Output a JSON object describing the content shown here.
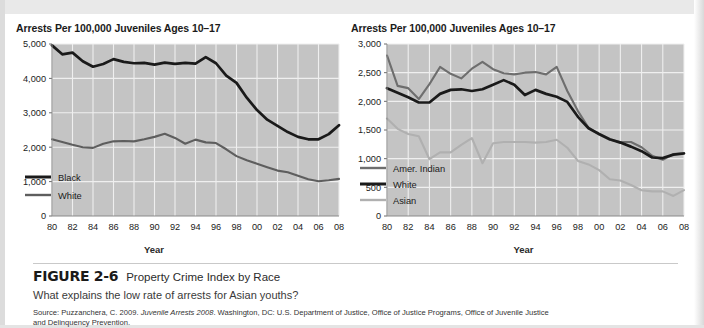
{
  "figure": {
    "number": "FIGURE 2-6",
    "title": "Property Crime Index by Race",
    "question": "What explains the low rate of arrests for Asian youths?",
    "source_prefix": "Source: Puzzanchera, C. 2009. ",
    "source_italic": "Juvenile Arrests 2008",
    "source_suffix": ". Washington, DC: U.S. Department of Justice, Office of Justice Programs, Office of Juvenile Justice",
    "source_line2": "and Delinquency Prevention."
  },
  "colors": {
    "plot_background": "#c4c4c4",
    "gridline": "#efefef",
    "black_series": "#1a1a1a",
    "white_series": "#5e5e5e",
    "amer_indian_series": "#6e6e6e",
    "asian_series": "#b0b0b0",
    "text": "#1b1b1b"
  },
  "chart_data": [
    {
      "id": "left",
      "type": "line",
      "title": "Arrests Per 100,000 Juveniles Ages 10–17",
      "xlabel": "Year",
      "ylabel": "",
      "ylim": [
        0,
        5000
      ],
      "yticks": [
        0,
        1000,
        2000,
        3000,
        4000,
        5000
      ],
      "ytick_labels": [
        "0",
        "1,000",
        "2,000",
        "3,000",
        "4,000",
        "5,000"
      ],
      "x": [
        1980,
        1981,
        1982,
        1983,
        1984,
        1985,
        1986,
        1987,
        1988,
        1989,
        1990,
        1991,
        1992,
        1993,
        1994,
        1995,
        1996,
        1997,
        1998,
        1999,
        2000,
        2001,
        2002,
        2003,
        2004,
        2005,
        2006,
        2007,
        2008
      ],
      "xtick_labels": [
        "80",
        "82",
        "84",
        "86",
        "88",
        "90",
        "92",
        "94",
        "96",
        "98",
        "00",
        "02",
        "04",
        "06",
        "08"
      ],
      "grid": true,
      "legend_position": "inside-lower-left",
      "series": [
        {
          "name": "Black",
          "color": "#1a1a1a",
          "values": [
            4960,
            4700,
            4750,
            4500,
            4340,
            4420,
            4560,
            4480,
            4440,
            4450,
            4400,
            4460,
            4420,
            4450,
            4430,
            4620,
            4440,
            4080,
            3870,
            3440,
            3080,
            2800,
            2620,
            2440,
            2300,
            2230,
            2230,
            2380,
            2640
          ]
        },
        {
          "name": "White",
          "color": "#5e5e5e",
          "values": [
            2230,
            2150,
            2070,
            2000,
            1980,
            2100,
            2170,
            2180,
            2170,
            2230,
            2300,
            2390,
            2270,
            2100,
            2220,
            2140,
            2120,
            1940,
            1740,
            1620,
            1520,
            1420,
            1320,
            1270,
            1170,
            1070,
            1010,
            1040,
            1080
          ]
        }
      ]
    },
    {
      "id": "right",
      "type": "line",
      "title": "Arrests Per 100,000 Juveniles Ages 10–17",
      "xlabel": "Year",
      "ylabel": "",
      "ylim": [
        0,
        3000
      ],
      "yticks": [
        0,
        500,
        1000,
        1500,
        2000,
        2500,
        3000
      ],
      "ytick_labels": [
        "0",
        "500",
        "1,000",
        "1,500",
        "2,000",
        "2,500",
        "3,000"
      ],
      "x": [
        1980,
        1981,
        1982,
        1983,
        1984,
        1985,
        1986,
        1987,
        1988,
        1989,
        1990,
        1991,
        1992,
        1993,
        1994,
        1995,
        1996,
        1997,
        1998,
        1999,
        2000,
        2001,
        2002,
        2003,
        2004,
        2005,
        2006,
        2007,
        2008
      ],
      "xtick_labels": [
        "80",
        "82",
        "84",
        "86",
        "88",
        "90",
        "92",
        "94",
        "96",
        "98",
        "00",
        "02",
        "04",
        "06",
        "08"
      ],
      "grid": true,
      "legend_position": "inside-lower-left",
      "series": [
        {
          "name": "Amer. Indian",
          "color": "#6e6e6e",
          "values": [
            2800,
            2270,
            2230,
            2040,
            2300,
            2600,
            2480,
            2400,
            2570,
            2690,
            2560,
            2490,
            2470,
            2500,
            2510,
            2470,
            2600,
            2180,
            1830,
            1540,
            1420,
            1330,
            1290,
            1290,
            1200,
            1050,
            980,
            1080,
            1100
          ]
        },
        {
          "name": "White",
          "color": "#1a1a1a",
          "values": [
            2230,
            2150,
            2070,
            1980,
            1980,
            2130,
            2200,
            2210,
            2180,
            2210,
            2290,
            2370,
            2290,
            2110,
            2200,
            2130,
            2080,
            1990,
            1730,
            1530,
            1430,
            1340,
            1280,
            1210,
            1130,
            1020,
            1010,
            1070,
            1090
          ]
        },
        {
          "name": "Asian",
          "color": "#b0b0b0",
          "values": [
            1700,
            1520,
            1430,
            1390,
            990,
            1110,
            1110,
            1240,
            1360,
            920,
            1270,
            1290,
            1290,
            1290,
            1280,
            1290,
            1330,
            1190,
            960,
            900,
            800,
            640,
            620,
            540,
            450,
            430,
            430,
            350,
            450
          ]
        }
      ]
    }
  ]
}
